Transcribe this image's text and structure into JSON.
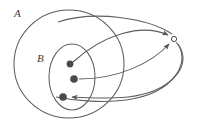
{
  "figure": {
    "kind": "set-mapping-diagram",
    "background_color": "#ffffff",
    "stroke_color": "#5a5a5a",
    "dot_color": "#4a4a4a",
    "label_color": "#3a3a3a",
    "width": 199,
    "height": 123
  },
  "labels": {
    "outer_set": "A",
    "inner_set": "B"
  },
  "sets": [
    {
      "name": "A",
      "label": "A",
      "shape": "ellipse",
      "cx": 69,
      "cy": 64,
      "rx": 55,
      "ry": 54,
      "label_x": 14,
      "label_y": 8
    },
    {
      "name": "B",
      "label": "B",
      "shape": "ellipse",
      "cx": 72,
      "cy": 77,
      "rx": 23,
      "ry": 33,
      "label_x": 37,
      "label_y": 53
    }
  ],
  "points": [
    {
      "name": "point-1",
      "x": 70,
      "y": 64,
      "r": 3.4,
      "filled": true
    },
    {
      "name": "point-2",
      "x": 74,
      "y": 79,
      "r": 3.8,
      "filled": true
    },
    {
      "name": "point-3",
      "x": 63,
      "y": 97,
      "r": 3.8,
      "filled": true
    },
    {
      "name": "target-point",
      "x": 174,
      "y": 39,
      "r": 2.6,
      "filled": false
    }
  ],
  "arrows": [
    {
      "name": "arrow-point1-to-target",
      "from": "point-1",
      "to": "target-point",
      "path": "M 73 62 C 104 34, 140 24, 168 36",
      "arrowhead": "end"
    },
    {
      "name": "arrow-point2-to-target",
      "from": "point-2",
      "to": "target-point",
      "path": "M 78 79 C 116 78, 150 62, 169 43",
      "arrowhead": "end"
    },
    {
      "name": "arrow-target-to-point3",
      "from": "target-point",
      "to": "point-3",
      "path": "M 176 42 C 196 62, 178 95, 130 100 C 110 102, 90 99, 68 97",
      "arrowhead": "end"
    }
  ],
  "outlines": [
    {
      "name": "outer-sweep-curve",
      "path": "M 92 18 C 130 18, 170 24, 176 38"
    },
    {
      "name": "lower-sweep-curve",
      "path": "M 176 42 C 190 60, 172 90, 126 99"
    }
  ]
}
